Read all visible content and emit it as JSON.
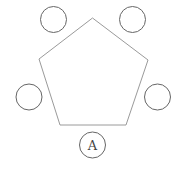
{
  "diagram": {
    "title": "",
    "pentagon": {
      "points": "92.5,18 148,60 126,125 60,125 39,59",
      "stroke": "#9a9a9a"
    },
    "seats": [
      {
        "id": "top-left",
        "cx": 53.5,
        "cy": 19.5,
        "r": 13,
        "label": ""
      },
      {
        "id": "top-right",
        "cx": 132.5,
        "cy": 19.5,
        "r": 13,
        "label": ""
      },
      {
        "id": "left",
        "cx": 29,
        "cy": 97,
        "r": 13,
        "label": ""
      },
      {
        "id": "right",
        "cx": 157.5,
        "cy": 97,
        "r": 13,
        "label": ""
      },
      {
        "id": "bottom",
        "cx": 92.5,
        "cy": 145,
        "r": 13,
        "label": "A"
      }
    ],
    "circle_stroke": "#666666"
  }
}
